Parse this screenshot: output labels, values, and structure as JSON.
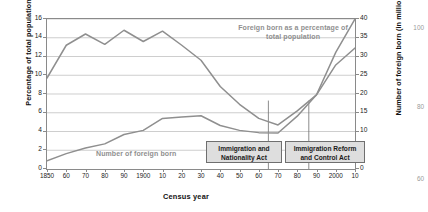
{
  "chart_data": {
    "type": "line",
    "title": "",
    "xlabel": "Census year",
    "ylabel_left": "Percentage of total population",
    "ylabel_right": "Number of foreign born (in millions)",
    "grid": true,
    "legend_position": "inline-labels",
    "x": [
      1850,
      1860,
      1870,
      1880,
      1890,
      1900,
      1910,
      1920,
      1930,
      1940,
      1950,
      1960,
      1970,
      1980,
      1990,
      2000,
      2010
    ],
    "xtick_labels": [
      "1850",
      "60",
      "70",
      "80",
      "90",
      "1900",
      "10",
      "20",
      "30",
      "40",
      "50",
      "60",
      "70",
      "80",
      "90",
      "2000",
      "10"
    ],
    "ylim_left": [
      0,
      16
    ],
    "ytick_left": [
      0,
      2,
      4,
      6,
      8,
      10,
      12,
      14,
      16
    ],
    "ylim_right": [
      0,
      40
    ],
    "ytick_right": [
      0,
      5,
      10,
      15,
      20,
      25,
      30,
      35,
      40
    ],
    "series": [
      {
        "name": "Foreign born as a percentage of total population",
        "axis": "left",
        "unit": "percent",
        "color": "#8f8f8f",
        "values": [
          9.7,
          13.2,
          14.4,
          13.3,
          14.8,
          13.6,
          14.7,
          13.2,
          11.6,
          8.8,
          6.9,
          5.4,
          4.7,
          6.2,
          7.9,
          11.1,
          12.9
        ]
      },
      {
        "name": "Number of foreign born",
        "axis": "right",
        "unit": "millions",
        "color": "#8f8f8f",
        "values": [
          2.2,
          4.1,
          5.6,
          6.7,
          9.2,
          10.3,
          13.5,
          13.9,
          14.2,
          11.6,
          10.3,
          9.7,
          9.6,
          14.1,
          19.8,
          31.1,
          40.0
        ]
      }
    ],
    "annotations": [
      {
        "label": "Immigration and Nationality Act",
        "year": 1965
      },
      {
        "label": "Immigration Reform and Control Act",
        "year": 1986
      }
    ],
    "inline_labels": [
      {
        "id": "pct",
        "text": "Foreign born as a percentage of total population"
      },
      {
        "id": "num",
        "text": "Number of foreign born"
      }
    ]
  },
  "edge_numbers": {
    "top": "100",
    "middle": "80",
    "bottom": "60"
  }
}
